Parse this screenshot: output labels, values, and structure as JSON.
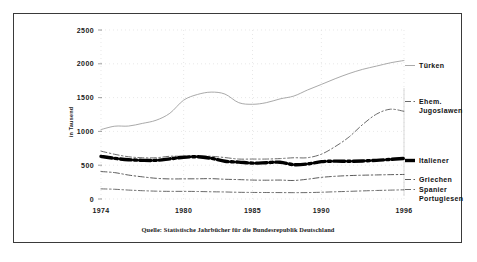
{
  "figure": {
    "y_axis_title": "in Tausend",
    "source_note": "Quelle: Statistische Jahrbücher für die Bundesrepublik Deutschland"
  },
  "legend": {
    "tuerken": "Türken",
    "jugoslawen_line1": "Ehem.",
    "jugoslawen_line2": "Jugoslawen",
    "italiener": "Italiener",
    "griechen": "Griechen",
    "spanier": "Spanier",
    "portugiesen": "Portugiesen"
  },
  "axis": {
    "y_ticks": [
      "0",
      "500",
      "1000",
      "1500",
      "2000",
      "2500"
    ],
    "x_ticks": [
      "1974",
      "1980",
      "1985",
      "1990",
      "1996"
    ]
  },
  "chart_data": {
    "type": "line",
    "title": "",
    "subtitle": "",
    "xlabel": "",
    "ylabel": "in Tausend",
    "xlim": [
      1974,
      1996
    ],
    "ylim": [
      0,
      2500
    ],
    "ytick_values": [
      0,
      500,
      1000,
      1500,
      2000,
      2500
    ],
    "xtick_values": [
      1974,
      1980,
      1985,
      1990,
      1996
    ],
    "grid": true,
    "legend_position": "right-outside",
    "source": "Quelle: Statistische Jahrbücher für die Bundesrepublik Deutschland",
    "x": [
      1974,
      1975,
      1976,
      1977,
      1978,
      1979,
      1980,
      1981,
      1982,
      1983,
      1984,
      1985,
      1986,
      1987,
      1988,
      1989,
      1990,
      1991,
      1992,
      1993,
      1994,
      1995,
      1996
    ],
    "series": [
      {
        "name": "Türken",
        "style": "solid-thin",
        "color": "#9a9a9a",
        "values": [
          1027,
          1077,
          1079,
          1118,
          1165,
          1268,
          1462,
          1546,
          1581,
          1552,
          1425,
          1401,
          1425,
          1481,
          1523,
          1613,
          1695,
          1779,
          1855,
          1918,
          1966,
          2014,
          2049
        ]
      },
      {
        "name": "Ehem. Jugoslawen",
        "style": "dash-dot-thin",
        "color": "#5a5a5a",
        "values": [
          708,
          661,
          625,
          610,
          610,
          632,
          632,
          637,
          632,
          613,
          591,
          591,
          591,
          598,
          610,
          611,
          663,
          775,
          916,
          1102,
          1255,
          1328,
          1297
        ]
      },
      {
        "name": "Italiener",
        "style": "dash-dot-thick",
        "color": "#000000",
        "values": [
          630,
          601,
          581,
          572,
          572,
          594,
          618,
          625,
          602,
          558,
          546,
          531,
          537,
          544,
          508,
          519,
          552,
          560,
          558,
          563,
          572,
          586,
          599
        ]
      },
      {
        "name": "Griechen",
        "style": "dash-dot-thin",
        "color": "#4a4a4a",
        "values": [
          406,
          390,
          354,
          328,
          306,
          297,
          298,
          299,
          301,
          292,
          287,
          280,
          278,
          280,
          274,
          293,
          320,
          336,
          346,
          352,
          356,
          360,
          363
        ]
      },
      {
        "name": "Spanier / Portugiesen",
        "style": "dash-dot-thin",
        "color": "#5a5a5a",
        "values": [
          150,
          144,
          132,
          123,
          116,
          113,
          113,
          111,
          107,
          104,
          99,
          97,
          96,
          95,
          94,
          95,
          100,
          107,
          113,
          120,
          126,
          131,
          136
        ]
      }
    ]
  }
}
